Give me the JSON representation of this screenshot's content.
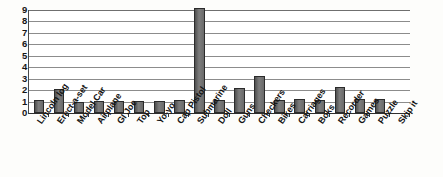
{
  "chart_data": {
    "type": "bar",
    "title": "",
    "subtitle": "",
    "xlabel": "",
    "ylabel": "",
    "ylim": [
      0,
      9
    ],
    "yticks": [
      0,
      1,
      2,
      3,
      4,
      5,
      6,
      7,
      8,
      9
    ],
    "grid": true,
    "legend": false,
    "legend_position": "none",
    "bar_color": "#6d6d6d",
    "bar_edge_color": "#2b2b2b",
    "gridline_color": "#8c8c8c",
    "axis_color": "#2e2e2e",
    "background_color": "#ffffff",
    "categories": [
      "Lincoln log",
      "Erect-a-set",
      "Model Car",
      "Airplane",
      "GI Joe",
      "Top",
      "Yo-yo",
      "Cap Pistol",
      "Submarine",
      "Doll",
      "Guns",
      "Checkers",
      "Bikes",
      "Carriages",
      "Boks",
      "Recorder",
      "Games",
      "Puzzle",
      "Skip it"
    ],
    "values": [
      1.1,
      2.1,
      1.0,
      1.05,
      1.05,
      1.05,
      1.05,
      1.1,
      9.2,
      1.15,
      2.2,
      3.2,
      1.15,
      1.2,
      1.15,
      2.25,
      1.2,
      1.25,
      0
    ]
  }
}
